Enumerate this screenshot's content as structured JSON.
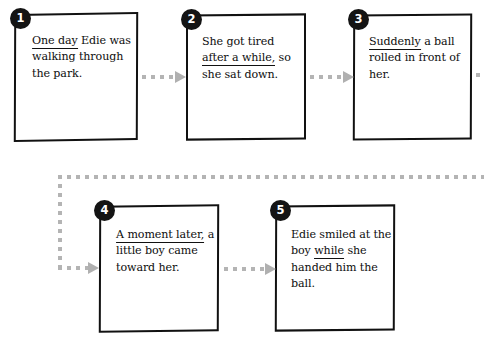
{
  "diagram": {
    "kind": "sequence-flowchart",
    "box_border_color": "#111111",
    "badge_color": "#141414",
    "badge_text_color": "#ffffff",
    "connector_color": "#b0b0b0",
    "background_color": "#ffffff"
  },
  "steps": [
    {
      "number": "1",
      "underlined": "One day",
      "rest": " Edie was walking through the park."
    },
    {
      "number": "2",
      "lead": "She got tired ",
      "underlined": "after a while,",
      "rest": " so she sat down."
    },
    {
      "number": "3",
      "underlined": "Suddenly",
      "rest": " a ball rolled in front of her."
    },
    {
      "number": "4",
      "underlined": "A moment later,",
      "rest": " a little boy came toward her."
    },
    {
      "number": "5",
      "lead": "Edie smiled at the boy ",
      "underlined": "while",
      "rest": " she handed him the ball."
    }
  ]
}
